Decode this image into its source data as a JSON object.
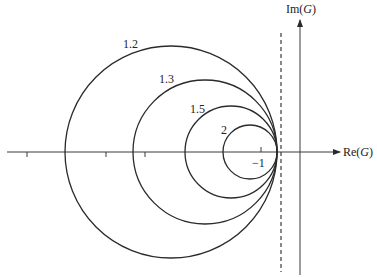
{
  "diagram": {
    "type": "nyquist-style circle family",
    "axes": {
      "x_label_prefix": "Re(",
      "x_label_var": "G",
      "x_label_suffix": ")",
      "y_label_prefix": "Im(",
      "y_label_var": "G",
      "y_label_suffix": ")",
      "minus_one_label": "−1"
    },
    "circles": [
      {
        "label": "1.2"
      },
      {
        "label": "1.3"
      },
      {
        "label": "1.5"
      },
      {
        "label": "2"
      }
    ],
    "colors": {
      "stroke": "#2a2a2a",
      "axis": "#3a3a3a"
    }
  }
}
